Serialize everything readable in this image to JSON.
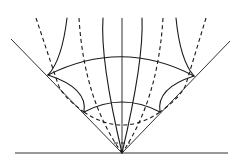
{
  "diagram": {
    "type": "light-cone geometry sketch",
    "colors": {
      "stroke": "#1a1a1a",
      "background": "#ffffff"
    },
    "baseline": {
      "x1": 15,
      "x2": 228,
      "y": 153
    },
    "apex": {
      "x": 122,
      "y": 153
    },
    "cone_lines": [
      {
        "x1": 122,
        "y1": 153,
        "x2": 11,
        "y2": 39
      },
      {
        "x1": 122,
        "y1": 153,
        "x2": 230,
        "y2": 41
      }
    ],
    "axis": {
      "x": 122,
      "y1": 18,
      "y2": 153
    },
    "solid_curves": [
      "M 67 18 Q 62 60 48 75",
      "M 103 18 Q 100 60 122 153",
      "M 142 18 Q 144 60 122 153",
      "M 176 18 Q 180 60 194 76"
    ],
    "dashed_curves": [
      "M 36 18 L 58 84 Q 62 96 84 112",
      "M 79 18 Q 84 100 122 153",
      "M 163 18 Q 158 100 122 153",
      "M 206 18 L 186 84 Q 182 96 160 112"
    ],
    "solid_arcs": [
      "M 48 75 Q 122 38 194 76",
      "M 84 112 Q 122 92 160 112"
    ],
    "inner_solid_curves": [
      "M 48 75 Q 88 88 84 112",
      "M 194 76 Q 156 88 160 112"
    ],
    "dashed_arcs": [
      "M 84 112 Q 122 138 160 112"
    ],
    "short_dash": {
      "x1": 114,
      "x2": 130,
      "y": 143
    }
  }
}
